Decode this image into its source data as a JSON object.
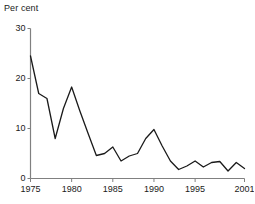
{
  "chart_data": {
    "type": "line",
    "title": "Per cent",
    "xlabel": "",
    "ylabel": "Per cent",
    "ylim": [
      0,
      30
    ],
    "xlim": [
      1975,
      2001
    ],
    "grid": false,
    "legend": null,
    "yticks": [
      0,
      10,
      20,
      30
    ],
    "ytick_labels": [
      "0",
      "10",
      "20",
      "30"
    ],
    "xticks": [
      1975,
      1980,
      1985,
      1990,
      1995,
      2001
    ],
    "xtick_labels": [
      "1975",
      "1980",
      "1985",
      "1990",
      "1995",
      "2001"
    ],
    "line_color": "#1a1a1a",
    "axis_color": "#808080",
    "x": [
      1975,
      1976,
      1977,
      1978,
      1979,
      1980,
      1981,
      1982,
      1983,
      1984,
      1985,
      1986,
      1987,
      1988,
      1989,
      1990,
      1991,
      1992,
      1993,
      1994,
      1995,
      1996,
      1997,
      1998,
      1999,
      2000,
      2001
    ],
    "values": [
      24.5,
      17.0,
      16.0,
      8.0,
      14.0,
      18.3,
      13.5,
      9.0,
      4.6,
      5.0,
      6.3,
      3.5,
      4.5,
      5.0,
      8.0,
      9.8,
      6.5,
      3.5,
      1.8,
      2.5,
      3.5,
      2.3,
      3.2,
      3.4,
      1.5,
      3.2,
      2.0
    ]
  }
}
